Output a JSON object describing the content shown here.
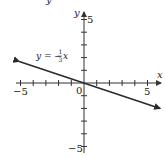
{
  "chart_data": {
    "type": "line",
    "title": "",
    "xlabel": "x",
    "ylabel": "y",
    "xlim": [
      -5,
      5
    ],
    "ylim": [
      -5,
      5
    ],
    "x_ticks": [
      -5,
      -4,
      -3,
      -2,
      -1,
      0,
      1,
      2,
      3,
      4,
      5
    ],
    "y_ticks": [
      -5,
      -4,
      -3,
      -2,
      -1,
      0,
      1,
      2,
      3,
      4,
      5
    ],
    "x_tick_labels": {
      "-5": "−5",
      "5": "5"
    },
    "y_tick_labels": {
      "5": "5",
      "-5": "−5"
    },
    "origin_label": "0",
    "grid": false,
    "legend": null,
    "series": [
      {
        "name": "y = −(1/3)x",
        "equation": "y = -1/3 x",
        "slope": -0.3333,
        "intercept": 0,
        "x": [
          -5.1,
          6.0
        ],
        "y": [
          1.7,
          -2.0
        ],
        "arrows_both_ends": true
      }
    ],
    "annotations": [
      {
        "text": "y = −(1/3)x",
        "x": -3.5,
        "y": 1.8
      }
    ]
  },
  "labels": {
    "x_axis": "x",
    "y_axis": "y",
    "origin": "0",
    "x_min": "−5",
    "x_max": "5",
    "y_max": "5",
    "y_min": "−5",
    "equation_prefix": "y = −",
    "equation_num": "1",
    "equation_den": "3",
    "equation_var": "x",
    "top_fragment": "y"
  },
  "colors": {
    "axis": "#333333",
    "line": "#2a2a2a",
    "text": "#222222"
  }
}
